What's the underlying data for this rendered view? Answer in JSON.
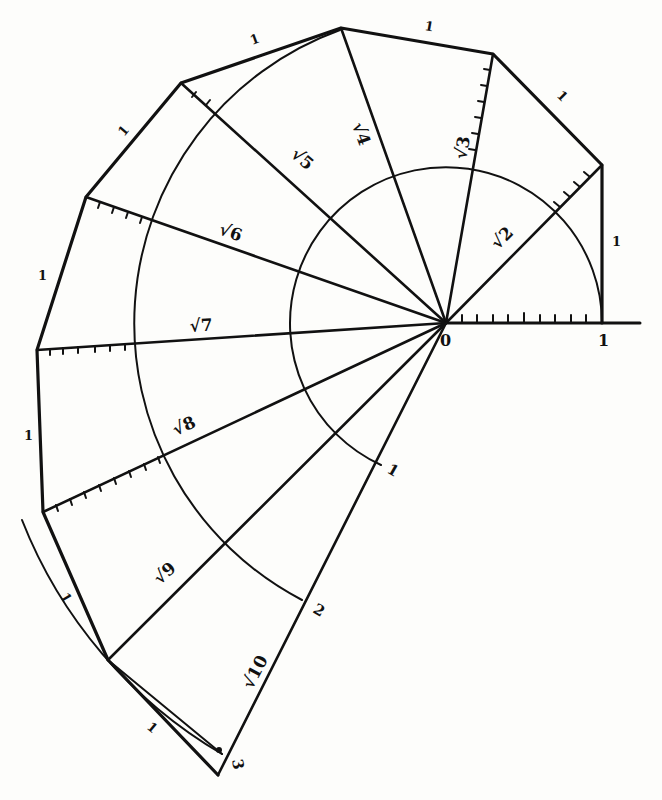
{
  "diagram": {
    "origin_label": "0",
    "axis_unit_label": "1",
    "hypotenuse_labels": [
      "√2",
      "√3",
      "√4",
      "√5",
      "√6",
      "√7",
      "√8",
      "√9",
      "√10"
    ],
    "leg_labels": [
      "1",
      "1",
      "1",
      "1",
      "1",
      "1",
      "1",
      "1",
      "1"
    ],
    "arc_labels": [
      "1",
      "2",
      "3"
    ],
    "colors": {
      "ink": "#111111",
      "paper": "#fdfdfb"
    }
  }
}
